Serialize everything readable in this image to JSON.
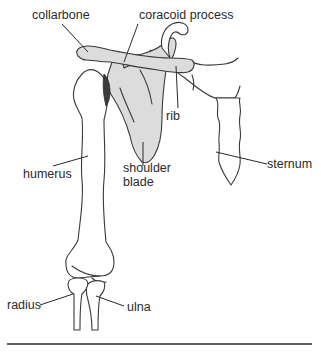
{
  "diagram": {
    "colors": {
      "outline": "#3a3a3a",
      "shaded_bone": "#dcdcdc",
      "cartilage": "#3b3b3b",
      "text": "#2a2a2a",
      "background": "#ffffff"
    },
    "labels": {
      "collarbone": "collarbone",
      "coracoid_process": "coracoid process",
      "rib": "rib",
      "shoulder_blade_line1": "shoulder",
      "shoulder_blade_line2": "blade",
      "humerus": "humerus",
      "sternum": "sternum",
      "radius": "radius",
      "ulna": "ulna"
    }
  }
}
